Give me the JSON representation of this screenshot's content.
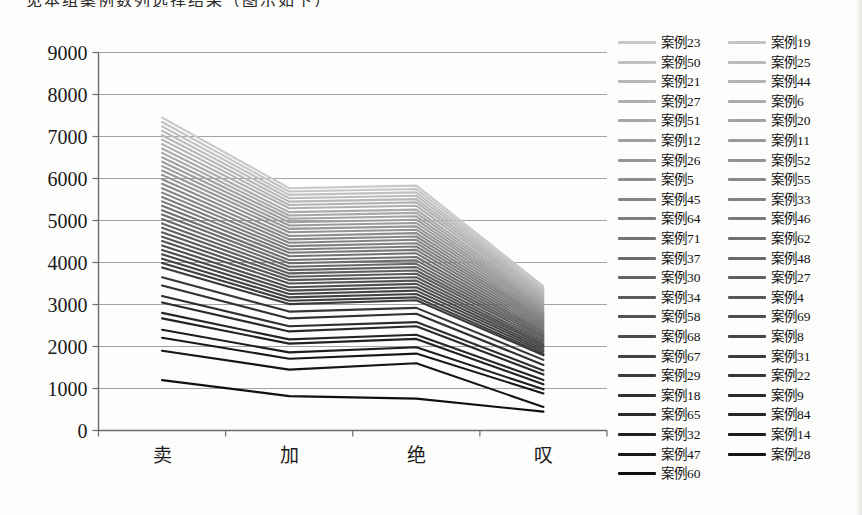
{
  "page": {
    "clipped_caption": "见本组案例数列选择结果（图示如下）"
  },
  "chart_data": {
    "type": "line",
    "title": "",
    "xlabel": "",
    "ylabel": "",
    "categories": [
      "卖",
      "加",
      "绝",
      "叹"
    ],
    "ylim": [
      0,
      9000
    ],
    "ytick_step": 1000,
    "ytick_labels": [
      "0",
      "1000",
      "2000",
      "3000",
      "4000",
      "5000",
      "6000",
      "7000",
      "8000",
      "9000"
    ],
    "grid": true,
    "legend_position": "right",
    "legend_columns": 2,
    "color_scale": {
      "first": "#c8c8c8",
      "last": "#101010"
    },
    "axis_color": "#6b6b6b",
    "gridline_color": "#a3a3a3",
    "text_color": "#1a1a1a",
    "series": [
      {
        "name": "案例23",
        "values": [
          7450,
          5770,
          5830,
          3430
        ]
      },
      {
        "name": "案例19",
        "values": [
          7345,
          5690,
          5750,
          3380
        ]
      },
      {
        "name": "案例50",
        "values": [
          7240,
          5610,
          5670,
          3330
        ]
      },
      {
        "name": "案例25",
        "values": [
          7135,
          5530,
          5590,
          3280
        ]
      },
      {
        "name": "案例21",
        "values": [
          7030,
          5450,
          5510,
          3230
        ]
      },
      {
        "name": "案例44",
        "values": [
          6925,
          5370,
          5430,
          3190
        ]
      },
      {
        "name": "案例27",
        "values": [
          6820,
          5290,
          5350,
          3140
        ]
      },
      {
        "name": "案例6",
        "values": [
          6715,
          5200,
          5260,
          3090
        ]
      },
      {
        "name": "案例51",
        "values": [
          6610,
          5120,
          5180,
          3040
        ]
      },
      {
        "name": "案例20",
        "values": [
          6505,
          5040,
          5100,
          2990
        ]
      },
      {
        "name": "案例12",
        "values": [
          6400,
          4960,
          5020,
          2940
        ]
      },
      {
        "name": "案例11",
        "values": [
          6295,
          4880,
          4940,
          2900
        ]
      },
      {
        "name": "案例26",
        "values": [
          6190,
          4800,
          4860,
          2850
        ]
      },
      {
        "name": "案例52",
        "values": [
          6085,
          4720,
          4780,
          2800
        ]
      },
      {
        "name": "案例5",
        "values": [
          5980,
          4630,
          4700,
          2750
        ]
      },
      {
        "name": "案例55",
        "values": [
          5875,
          4550,
          4620,
          2700
        ]
      },
      {
        "name": "案例45",
        "values": [
          5770,
          4470,
          4540,
          2650
        ]
      },
      {
        "name": "案例33",
        "values": [
          5665,
          4390,
          4460,
          2610
        ]
      },
      {
        "name": "案例64",
        "values": [
          5560,
          4310,
          4380,
          2560
        ]
      },
      {
        "name": "案例46",
        "values": [
          5455,
          4230,
          4300,
          2510
        ]
      },
      {
        "name": "案例71",
        "values": [
          5350,
          4150,
          4220,
          2460
        ]
      },
      {
        "name": "案例62",
        "values": [
          5245,
          4060,
          4130,
          2410
        ]
      },
      {
        "name": "案例37",
        "values": [
          5140,
          3980,
          4050,
          2360
        ]
      },
      {
        "name": "案例48",
        "values": [
          5035,
          3900,
          3970,
          2320
        ]
      },
      {
        "name": "案例30",
        "values": [
          4930,
          3820,
          3890,
          2270
        ]
      },
      {
        "name": "案例27",
        "values": [
          4825,
          3740,
          3810,
          2220
        ]
      },
      {
        "name": "案例34",
        "values": [
          4720,
          3660,
          3730,
          2170
        ]
      },
      {
        "name": "案例4",
        "values": [
          4615,
          3580,
          3650,
          2120
        ]
      },
      {
        "name": "案例58",
        "values": [
          4510,
          3500,
          3570,
          2070
        ]
      },
      {
        "name": "案例69",
        "values": [
          4405,
          3410,
          3490,
          2030
        ]
      },
      {
        "name": "案例68",
        "values": [
          4300,
          3330,
          3410,
          1980
        ]
      },
      {
        "name": "案例8",
        "values": [
          4195,
          3250,
          3330,
          1930
        ]
      },
      {
        "name": "案例67",
        "values": [
          4090,
          3170,
          3250,
          1880
        ]
      },
      {
        "name": "案例31",
        "values": [
          3985,
          3090,
          3170,
          1830
        ]
      },
      {
        "name": "案例29",
        "values": [
          3880,
          3010,
          3100,
          1790
        ]
      },
      {
        "name": "案例22",
        "values": [
          3650,
          2830,
          2920,
          1680
        ]
      },
      {
        "name": "案例18",
        "values": [
          3450,
          2670,
          2780,
          1560
        ]
      },
      {
        "name": "案例9",
        "values": [
          3200,
          2480,
          2580,
          1430
        ]
      },
      {
        "name": "案例65",
        "values": [
          3050,
          2360,
          2480,
          1330
        ]
      },
      {
        "name": "案例84",
        "values": [
          2800,
          2170,
          2280,
          1200
        ]
      },
      {
        "name": "案例32",
        "values": [
          2670,
          2070,
          2180,
          1100
        ]
      },
      {
        "name": "案例14",
        "values": [
          2400,
          1860,
          1980,
          980
        ]
      },
      {
        "name": "案例47",
        "values": [
          2210,
          1710,
          1830,
          880
        ]
      },
      {
        "name": "案例28",
        "values": [
          1900,
          1450,
          1600,
          560
        ]
      },
      {
        "name": "案例60",
        "values": [
          1200,
          820,
          760,
          450
        ]
      }
    ]
  }
}
